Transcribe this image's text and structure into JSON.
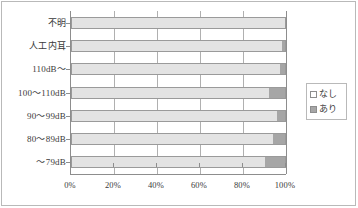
{
  "chart_data": {
    "type": "bar",
    "orientation": "horizontal",
    "stacked": true,
    "stacked_percent": true,
    "title": "",
    "xlabel": "",
    "ylabel": "",
    "xlim": [
      0,
      100
    ],
    "xticks": [
      "0%",
      "20%",
      "40%",
      "60%",
      "80%",
      "100%"
    ],
    "xtick_values": [
      0,
      20,
      40,
      60,
      80,
      100
    ],
    "grid": true,
    "grid_axis": "x",
    "legend_position": "right",
    "categories": [
      "不明",
      "人工内耳",
      "110dB～",
      "100～110dB",
      "90～99dB",
      "80～89dB",
      "～79dB"
    ],
    "series": [
      {
        "name": "なし",
        "color": "#e3e3e3",
        "values": [
          100,
          98,
          97,
          92,
          96,
          94,
          90
        ]
      },
      {
        "name": "あり",
        "color": "#a6a6a6",
        "values": [
          0,
          2,
          3,
          8,
          4,
          6,
          10
        ]
      }
    ]
  },
  "legend": {
    "items": [
      {
        "label": "なし",
        "swatch": "nashi"
      },
      {
        "label": "あり",
        "swatch": "ari"
      }
    ]
  },
  "colors": {
    "nashi_fill": "#e3e3e3",
    "ari_fill": "#a6a6a6",
    "bar_border": "#9a9a9a",
    "axis": "#8d8d8d",
    "grid": "#b0b0b0",
    "frame": "#b9b9b9",
    "text": "#3a3a3a",
    "background": "#ffffff"
  }
}
